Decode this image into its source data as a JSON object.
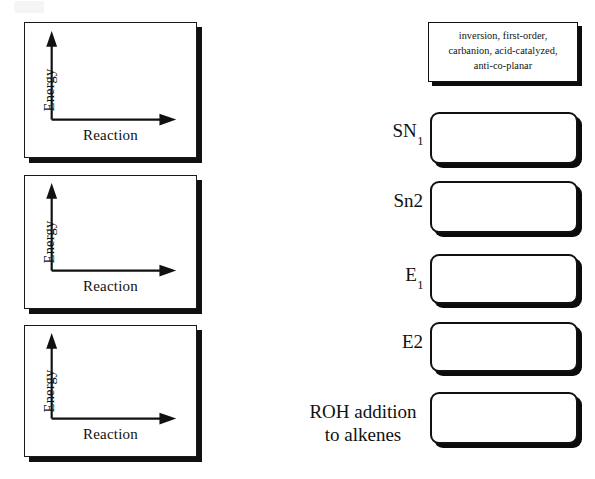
{
  "worksheet": {
    "title": "Reaction mechanism matching worksheet",
    "energy_panels": [
      {
        "y_axis_label": "Energy",
        "x_axis_label": "Reaction"
      },
      {
        "y_axis_label": "Energy",
        "x_axis_label": "Reaction"
      },
      {
        "y_axis_label": "Energy",
        "x_axis_label": "Reaction"
      }
    ],
    "clue_box": {
      "lines": [
        "inversion, first-order,",
        "carbanion, acid-catalyzed,",
        "anti-co-planar"
      ]
    },
    "terms": [
      {
        "text": "SN",
        "sub": "1",
        "lines": null
      },
      {
        "text": "Sn2",
        "sub": "",
        "lines": null
      },
      {
        "text": "E",
        "sub": "1",
        "lines": null
      },
      {
        "text": "E2",
        "sub": "",
        "lines": null
      },
      {
        "text": "",
        "sub": "",
        "lines": [
          "ROH addition",
          "to alkenes"
        ]
      }
    ],
    "answer_boxes": [
      {
        "value": "",
        "placeholder": ""
      },
      {
        "value": "",
        "placeholder": ""
      },
      {
        "value": "",
        "placeholder": ""
      },
      {
        "value": "",
        "placeholder": ""
      },
      {
        "value": "",
        "placeholder": ""
      }
    ]
  }
}
